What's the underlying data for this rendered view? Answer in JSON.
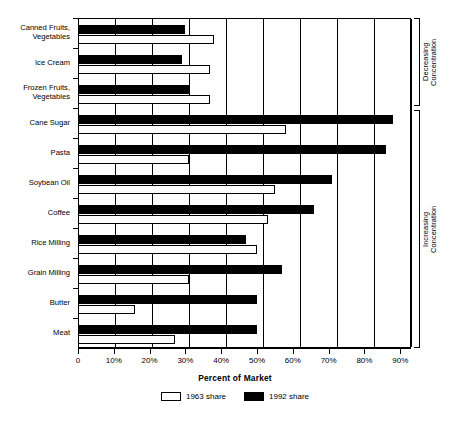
{
  "chart_data": {
    "type": "bar",
    "orientation": "horizontal",
    "title": "",
    "xlabel": "Percent of Market",
    "ylabel": "",
    "xlim": [
      0,
      93
    ],
    "grid": true,
    "legend_position": "bottom",
    "tick_labels": [
      "0",
      "10%",
      "20%",
      "30%",
      "40%",
      "50%",
      "60%",
      "70%",
      "80%",
      "90%"
    ],
    "tick_values": [
      0,
      10,
      20,
      30,
      40,
      50,
      60,
      70,
      80,
      90
    ],
    "categories": [
      "Canned Fruits,\nVegetables",
      "Ice Cream",
      "Frozen Fruits,\nVegetables",
      "Cane Sugar",
      "Pasta",
      "Soybean Oil",
      "Coffee",
      "Rice Milling",
      "Grain Milling",
      "Butter",
      "Meat"
    ],
    "series": [
      {
        "name": "1963 share",
        "color": "#ffffff",
        "values": [
          38,
          37,
          37,
          58,
          31,
          55,
          53,
          50,
          31,
          16,
          27
        ]
      },
      {
        "name": "1992 share",
        "color": "#000000",
        "values": [
          30,
          29,
          31,
          88,
          86,
          71,
          66,
          47,
          57,
          50,
          50
        ]
      }
    ],
    "annotations": [
      {
        "label": "Decreasing\nConcentration",
        "applies_to": [
          "Canned Fruits,\nVegetables",
          "Ice Cream",
          "Frozen Fruits,\nVegetables"
        ]
      },
      {
        "label": "Increasing\nConcentration",
        "applies_to": [
          "Cane Sugar",
          "Pasta",
          "Soybean Oil",
          "Coffee",
          "Rice Milling",
          "Grain Milling",
          "Butter",
          "Meat"
        ]
      }
    ]
  },
  "legend": {
    "items": [
      {
        "label": "1963 share",
        "swatch": "white"
      },
      {
        "label": "1992 share",
        "swatch": "black"
      }
    ]
  },
  "brackets": {
    "decreasing": "Decreasing\nConcentration",
    "increasing": "Increasing\nConcentration"
  }
}
